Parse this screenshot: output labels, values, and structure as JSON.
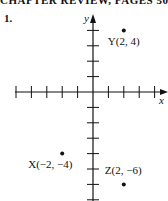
{
  "header": {
    "title": "CHAPTER REVIEW, PAGES 505–",
    "problem_number": "1."
  },
  "chart_data": {
    "type": "scatter",
    "title": "",
    "xlabel": "x",
    "ylabel": "y",
    "grid": false,
    "tick_spacing": 1,
    "xlim": [
      -5,
      4
    ],
    "ylim": [
      -7,
      5
    ],
    "points": [
      {
        "name": "Y",
        "x": 2,
        "y": 4,
        "label": "Y(2, 4)"
      },
      {
        "name": "X",
        "x": -2,
        "y": -4,
        "label": "X(−2, −4)"
      },
      {
        "name": "Z",
        "x": 2,
        "y": -6,
        "label": "Z(2, −6)"
      }
    ]
  },
  "colors": {
    "ink": "#111111",
    "background": "#ffffff"
  }
}
